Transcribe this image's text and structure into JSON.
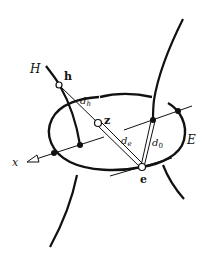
{
  "diagram": {
    "labels": {
      "H": "H",
      "h": "h",
      "z": "z",
      "e": "e",
      "E": "E",
      "x": "x",
      "d_h": "d",
      "d_h_sub": "h",
      "d_e": "d",
      "d_e_sub": "e",
      "d_0": "d",
      "d_0_sub": "0"
    },
    "points": {
      "h": {
        "x": 59,
        "y": 85,
        "style": "hollow"
      },
      "z": {
        "x": 98,
        "y": 123,
        "style": "hollow"
      },
      "e": {
        "x": 142,
        "y": 167,
        "style": "hollow"
      },
      "e0_foot": {
        "x": 153,
        "y": 120,
        "style": "filled"
      },
      "E_right_intersection": {
        "x": 178,
        "y": 111,
        "style": "filled"
      },
      "H_axis_intersection": {
        "x": 80,
        "y": 145,
        "style": "filled"
      },
      "E_left_intersection": {
        "x": 54,
        "y": 153,
        "style": "filled"
      }
    },
    "colors": {
      "stroke": "#111111",
      "background": "#ffffff"
    }
  }
}
